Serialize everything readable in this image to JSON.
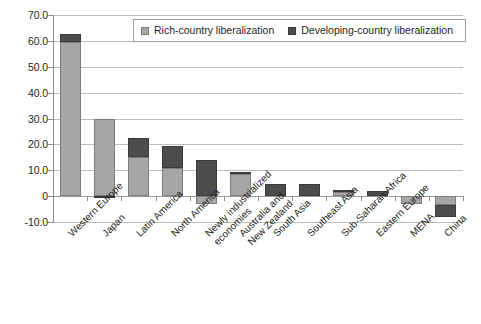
{
  "chart_data": {
    "type": "bar",
    "stacked": true,
    "title": "",
    "subtitle": "",
    "xlabel": "",
    "ylabel": "",
    "ylim": [
      -10.0,
      70.0
    ],
    "ytick_labels": [
      "70.0",
      "60.0",
      "50.0",
      "40.0",
      "30.0",
      "20.0",
      "10.0",
      "0",
      "-10.0"
    ],
    "ytick_values": [
      70.0,
      60.0,
      50.0,
      40.0,
      30.0,
      20.0,
      10.0,
      0,
      -10.0
    ],
    "grid": true,
    "legend_position": "top-center",
    "categories": [
      "Western Europe",
      "Japan",
      "Latin America",
      "North America",
      "Newly industrialized economies",
      "Australia and New Zealand",
      "South Asia",
      "Southeast Asia",
      "Sub-Saharan Africa",
      "Eastern Europe",
      "MENA",
      "China"
    ],
    "category_lines": [
      [
        "Western Europe"
      ],
      [
        "Japan"
      ],
      [
        "Latin America"
      ],
      [
        "North America"
      ],
      [
        "Newly industrialized",
        "economies"
      ],
      [
        "Australia and",
        "New Zealand"
      ],
      [
        "South Asia"
      ],
      [
        "Southeast Asia"
      ],
      [
        "Sub-Saharan Africa"
      ],
      [
        "Eastern Europe"
      ],
      [
        "MENA"
      ],
      [
        "China"
      ]
    ],
    "series": [
      {
        "name": "Rich-country liberalization",
        "color": "#a6a6a6",
        "values": [
          59.5,
          30.0,
          15.0,
          11.0,
          -3.0,
          8.5,
          0.0,
          0.0,
          1.5,
          0.0,
          -3.0,
          -3.5
        ]
      },
      {
        "name": "Developing-country liberalization",
        "color": "#4d4d4d",
        "values": [
          3.0,
          -0.5,
          7.5,
          8.5,
          14.0,
          1.0,
          4.5,
          4.5,
          1.0,
          1.8,
          0.0,
          -4.5
        ]
      }
    ],
    "totals": [
      62.5,
      29.5,
      22.5,
      19.5,
      11.0,
      9.5,
      4.5,
      4.5,
      2.5,
      1.8,
      -3.0,
      -8.0
    ]
  },
  "legend": {
    "items": [
      {
        "label": "Rich-country liberalization",
        "swatch": "rich-swatch-icon"
      },
      {
        "label": "Developing-country liberalization",
        "swatch": "developing-swatch-icon"
      }
    ]
  },
  "colors": {
    "rich": "#a6a6a6",
    "developing": "#4d4d4d",
    "grid": "#bcbcbc",
    "axis": "#8d8d8d",
    "text": "#231f20",
    "background": "#ffffff"
  }
}
